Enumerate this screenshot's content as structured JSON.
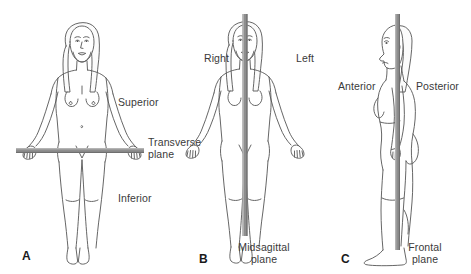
{
  "figure": {
    "background_color": "#ffffff",
    "line_color": "#4a4a4a",
    "plane_color": "#8a8a8a",
    "label_color": "#3a3a3a"
  },
  "panels": [
    {
      "letter": "A",
      "view": "anterior-view-arms-abducted",
      "plane_name": "Transverse plane",
      "plane_orientation": "horizontal",
      "labels": {
        "superior": "Superior",
        "plane": "Transverse\nplane",
        "inferior": "Inferior"
      }
    },
    {
      "letter": "B",
      "view": "anterior-view-arms-abducted",
      "plane_name": "Midsagittal plane",
      "plane_orientation": "vertical",
      "labels": {
        "right": "Right",
        "left": "Left",
        "plane": "Midsagittal\nplane"
      }
    },
    {
      "letter": "C",
      "view": "lateral-profile-view",
      "plane_name": "Frontal plane",
      "plane_orientation": "vertical",
      "labels": {
        "anterior": "Anterior",
        "posterior": "Posterior",
        "plane": "Frontal\nplane"
      }
    }
  ]
}
